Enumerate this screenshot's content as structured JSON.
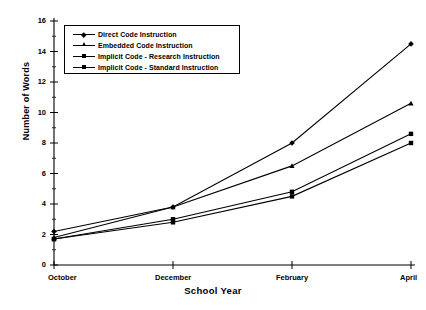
{
  "chart_data": {
    "type": "line",
    "title": "",
    "xlabel": "School Year",
    "ylabel": "Number of Words",
    "categories": [
      "October",
      "December",
      "February",
      "April"
    ],
    "ylim": [
      0,
      16
    ],
    "yticks": [
      0,
      2,
      4,
      6,
      8,
      10,
      12,
      14,
      16
    ],
    "grid": false,
    "legend_position": "upper-left-inside",
    "series": [
      {
        "name": "Direct Code Instruction",
        "marker": "diamond",
        "values": [
          2.2,
          3.8,
          8.0,
          14.5
        ]
      },
      {
        "name": "Embedded Code Instruction",
        "marker": "triangle",
        "values": [
          1.8,
          3.8,
          6.5,
          10.6
        ]
      },
      {
        "name": "Implicit Code - Research Instruction",
        "marker": "square",
        "values": [
          1.7,
          3.0,
          4.8,
          8.6
        ]
      },
      {
        "name": "Implicit Code - Standard Instruction",
        "marker": "square",
        "values": [
          1.7,
          2.8,
          4.5,
          8.0
        ]
      }
    ]
  },
  "axis": {
    "y_title": "Number of Words",
    "x_title": "School Year",
    "y_tick_labels": [
      "0",
      "2",
      "4",
      "6",
      "8",
      "10",
      "12",
      "14",
      "16"
    ],
    "x_tick_labels": [
      "October",
      "December",
      "February",
      "April"
    ]
  },
  "legend": {
    "entries": [
      {
        "label": "Direct Code Instruction"
      },
      {
        "label": "Embedded Code Instruction"
      },
      {
        "label": "Implicit Code - Research Instruction"
      },
      {
        "label": "Implicit Code - Standard Instruction"
      }
    ]
  },
  "colors": {
    "line": "#000000",
    "axis": "#000000",
    "background": "#ffffff"
  }
}
